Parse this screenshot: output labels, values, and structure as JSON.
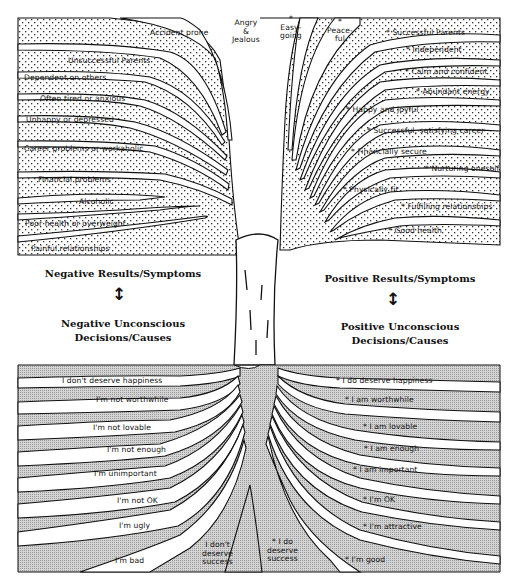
{
  "colors": {
    "ink": "#111111",
    "dot_fill": "#bdbdbd",
    "soil_fill": "#c8c8c8",
    "background": "#ffffff"
  },
  "headings": {
    "negative_results": "Negative Results/Symptoms",
    "negative_causes": "Negative Unconscious\nDecisions/Causes",
    "positive_results": "Positive Results/Symptoms",
    "positive_causes": "Positive Unconscious\nDecisions/Causes",
    "arrow_symbol": "↕"
  },
  "branches": {
    "top": [
      {
        "label": "Angry\n&\nJealous"
      },
      {
        "label": "*\nEasy-\ngoing"
      },
      {
        "label": "*\nPeace-\nful"
      }
    ],
    "negative": [
      {
        "label": "Accident prone"
      },
      {
        "label": "Unsuccessful Parents"
      },
      {
        "label": "Dependent on others"
      },
      {
        "label": "Often tired or anxious"
      },
      {
        "label": "Unhappy or depressed"
      },
      {
        "label": "Career problems or workaholic"
      },
      {
        "label": "Financial problems"
      },
      {
        "label": "Alcoholic"
      },
      {
        "label": "Poor health or overweight"
      },
      {
        "label": "Painful relationships"
      }
    ],
    "positive": [
      {
        "label": "* Successful Parents"
      },
      {
        "label": "* Independent"
      },
      {
        "label": "* Calm and confident"
      },
      {
        "label": "* Abundant energy"
      },
      {
        "label": "* Happy and joyful"
      },
      {
        "label": "* Successful, satisfying career"
      },
      {
        "label": "* Financially secure"
      },
      {
        "label": "* Nurturing oneself"
      },
      {
        "label": "* Physically fit"
      },
      {
        "label": "* Fulfilling relationships"
      },
      {
        "label": "* Good health"
      }
    ]
  },
  "roots": {
    "negative": [
      {
        "label": "I don't deserve happiness"
      },
      {
        "label": "I'm not worthwhile"
      },
      {
        "label": "I'm not lovable"
      },
      {
        "label": "I'm not enough"
      },
      {
        "label": "I'm unimportant"
      },
      {
        "label": "I'm not OK"
      },
      {
        "label": "I'm ugly"
      },
      {
        "label": "I'm bad"
      },
      {
        "label": "I don't\ndeserve\nsuccess"
      }
    ],
    "positive": [
      {
        "label": "* I do deserve happiness"
      },
      {
        "label": "* I am worthwhile"
      },
      {
        "label": "* I am lovable"
      },
      {
        "label": "* I am enough"
      },
      {
        "label": "* I am important"
      },
      {
        "label": "* I'm OK"
      },
      {
        "label": "* I'm attractive"
      },
      {
        "label": "* I'm good"
      },
      {
        "label": "* I do\ndeserve\nsuccess"
      }
    ]
  }
}
